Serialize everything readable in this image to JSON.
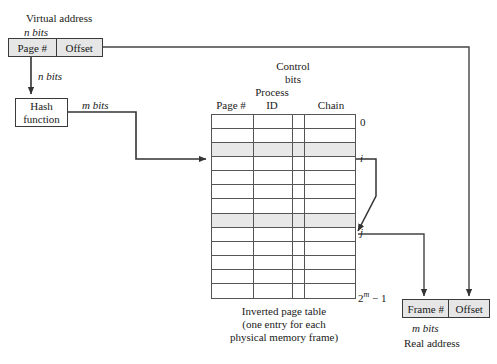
{
  "diagram": {
    "virtual_address": {
      "caption": "Virtual address",
      "bits_label": "n bits",
      "fields": [
        {
          "label": "Page #"
        },
        {
          "label": "Offset"
        }
      ]
    },
    "hash_arrow_label": "n bits",
    "hash_function": {
      "line1": "Hash",
      "line2": "function"
    },
    "hash_output_label": "m bits",
    "table": {
      "control_bits_line1": "Control",
      "control_bits_line2": "bits",
      "headers": [
        {
          "label": "Page #"
        },
        {
          "line1": "Process",
          "line2": "ID"
        },
        {
          "label": ""
        },
        {
          "label": "Chain"
        }
      ],
      "index_top": "0",
      "index_i": "i",
      "index_j": "j",
      "index_bottom_base": "2",
      "index_bottom_exp": "m",
      "index_bottom_tail": " − 1",
      "row_count": 13,
      "highlight_rows": [
        2,
        7
      ],
      "caption_line1": "Inverted page table",
      "caption_line2": "(one entry for each",
      "caption_line3": "physical memory frame)"
    },
    "real_address": {
      "fields": [
        {
          "label": "Frame #"
        },
        {
          "label": "Offset"
        }
      ],
      "bits_label": "m bits",
      "caption": "Real address"
    },
    "colors": {
      "line": "#555555",
      "box_border": "#3a3a3a",
      "box_fill": "#e6e6e6",
      "row_highlight": "#e8e8e8",
      "text": "#1a1a1a",
      "background": "#ffffff"
    }
  }
}
